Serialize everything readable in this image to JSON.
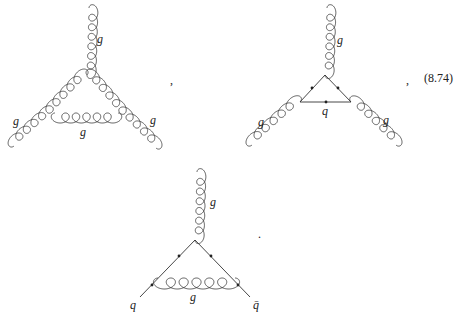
{
  "equation": {
    "number": "(8.74)",
    "separators": [
      ",",
      ",",
      "."
    ]
  },
  "diagrams": [
    {
      "name": "three-gluon-vertex-gluon-loop",
      "external_labels": {
        "top": "g",
        "left": "g",
        "right": "g"
      },
      "internal_label": "g"
    },
    {
      "name": "three-gluon-vertex-quark-loop",
      "external_labels": {
        "top": "g",
        "left": "g",
        "right": "g"
      },
      "internal_label": "q"
    },
    {
      "name": "quark-gluon-vertex-correction",
      "external_labels": {
        "top": "g",
        "left": "q",
        "right": "q̄"
      },
      "internal_label": "g"
    }
  ],
  "colors": {
    "ink": "#333333",
    "background": "#ffffff"
  }
}
